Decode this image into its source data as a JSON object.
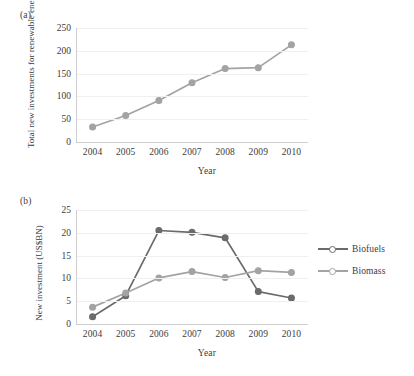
{
  "figure": {
    "background": "#ffffff",
    "panel_a_label": "(a)",
    "panel_b_label": "(b)"
  },
  "colors": {
    "biofuels": "#6b6b6b",
    "biomass": "#a3a3a3",
    "total": "#a3a3a3",
    "axis": "#cfcdcd",
    "grid": "#f0eeee",
    "text": "#3c3c3c"
  },
  "chart_data": [
    {
      "type": "line",
      "panel": "(a)",
      "title": "",
      "xlabel": "Year",
      "ylabel": "Total new investments for renewable energy (US$BN)",
      "categories": [
        "2004",
        "2005",
        "2006",
        "2007",
        "2008",
        "2009",
        "2010"
      ],
      "x": [
        2004,
        2005,
        2006,
        2007,
        2008,
        2009,
        2010
      ],
      "ylim": [
        0,
        250
      ],
      "yticks": [
        0,
        50,
        100,
        150,
        200,
        250
      ],
      "ytick_labels": [
        "0",
        "50",
        "100",
        "150",
        "200",
        "250"
      ],
      "grid": true,
      "legend": "none",
      "series": [
        {
          "name": "Total new investments for renewable energy",
          "color": "#a3a3a3",
          "marker": "circle",
          "values": [
            33,
            58,
            91,
            130,
            161,
            163,
            213
          ]
        }
      ]
    },
    {
      "type": "line",
      "panel": "(b)",
      "title": "",
      "xlabel": "Year",
      "ylabel": "New investment (US$BN)",
      "categories": [
        "2004",
        "2005",
        "2006",
        "2007",
        "2008",
        "2009",
        "2010"
      ],
      "x": [
        2004,
        2005,
        2006,
        2007,
        2008,
        2009,
        2010
      ],
      "ylim": [
        0,
        25
      ],
      "yticks": [
        0,
        5,
        10,
        15,
        20,
        25
      ],
      "ytick_labels": [
        "0",
        "5",
        "10",
        "15",
        "20",
        "25"
      ],
      "grid": true,
      "legend": "right",
      "series": [
        {
          "name": "Biofuels",
          "color": "#6b6b6b",
          "marker": "circle",
          "values": [
            1.6,
            6.2,
            20.5,
            20.1,
            18.9,
            7.1,
            5.7
          ]
        },
        {
          "name": "Biomass",
          "color": "#a3a3a3",
          "marker": "circle",
          "values": [
            3.7,
            6.8,
            10.1,
            11.5,
            10.2,
            11.7,
            11.3
          ]
        }
      ]
    }
  ],
  "legend": {
    "items": [
      {
        "label": "Biofuels",
        "color": "#6b6b6b"
      },
      {
        "label": "Biomass",
        "color": "#a3a3a3"
      }
    ]
  }
}
